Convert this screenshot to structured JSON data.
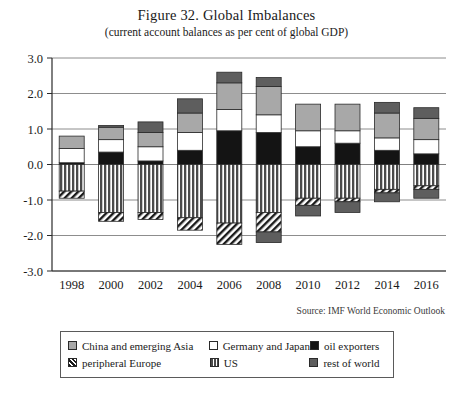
{
  "figure": {
    "title": "Figure 32. Global Imbalances",
    "subtitle": "(current account balances as per cent of global GDP)",
    "source": "Source: IMF World Economic Outlook"
  },
  "legend": {
    "entries": [
      {
        "label": "China and emerging Asia",
        "key": "china",
        "pattern": "solid-light-gray",
        "color": "#a8a8a8"
      },
      {
        "label": "Germany and Japan",
        "key": "germany_japan",
        "pattern": "solid-white",
        "color": "#ffffff"
      },
      {
        "label": "oil exporters",
        "key": "oil_exporters",
        "pattern": "solid-black",
        "color": "#111111"
      },
      {
        "label": "peripheral Europe",
        "key": "peripheral_europe",
        "pattern": "diagonal-hatch",
        "color": "#ffffff"
      },
      {
        "label": "US",
        "key": "us",
        "pattern": "vertical-stripes",
        "color": "#555555"
      },
      {
        "label": "rest of world",
        "key": "rest_of_world",
        "pattern": "solid-dark-gray",
        "color": "#5e5e5e"
      }
    ]
  },
  "chart_data": {
    "type": "bar",
    "subtype": "stacked-bar-diverging",
    "title": "Figure 32. Global Imbalances",
    "subtitle": "(current account balances as per cent of global GDP)",
    "xlabel": "",
    "ylabel": "",
    "ylim": [
      -3.0,
      3.0
    ],
    "yticks": [
      3.0,
      2.0,
      1.0,
      0.0,
      -1.0,
      -2.0,
      -3.0
    ],
    "ytick_labels": [
      "3.0",
      "2.0",
      "1.0",
      "0.0",
      "-1.0",
      "-2.0",
      "-3.0"
    ],
    "grid": true,
    "legend_position": "bottom",
    "categories": [
      "1998",
      "2000",
      "2002",
      "2004",
      "2006",
      "2008",
      "2010",
      "2012",
      "2014",
      "2016"
    ],
    "series": [
      {
        "name": "China and emerging Asia",
        "key": "china",
        "values": [
          0.35,
          0.35,
          0.4,
          0.55,
          0.75,
          0.8,
          0.75,
          0.75,
          0.7,
          0.6
        ]
      },
      {
        "name": "Germany and Japan",
        "key": "germany_japan",
        "values": [
          0.4,
          0.35,
          0.4,
          0.5,
          0.6,
          0.5,
          0.45,
          0.35,
          0.35,
          0.4
        ]
      },
      {
        "name": "oil exporters",
        "key": "oil_exporters",
        "values": [
          0.05,
          0.35,
          0.1,
          0.4,
          0.95,
          0.9,
          0.5,
          0.6,
          0.4,
          0.3
        ]
      },
      {
        "name": "rest of world",
        "key": "rest_of_world",
        "values": [
          0.0,
          0.05,
          0.3,
          0.4,
          0.3,
          0.25,
          0.0,
          0.0,
          0.3,
          0.3
        ]
      },
      {
        "name": "US",
        "key": "us",
        "values": [
          -0.75,
          -1.35,
          -1.35,
          -1.5,
          -1.65,
          -1.35,
          -0.95,
          -0.95,
          -0.7,
          -0.6
        ]
      },
      {
        "name": "peripheral Europe",
        "key": "peripheral_europe",
        "values": [
          -0.2,
          -0.25,
          -0.2,
          -0.35,
          -0.6,
          -0.55,
          -0.2,
          -0.1,
          -0.1,
          -0.1
        ]
      },
      {
        "name": "rest of world (negative)",
        "key": "rest_of_world_neg",
        "values": [
          0.0,
          0.0,
          0.0,
          0.0,
          0.0,
          -0.3,
          -0.3,
          -0.3,
          -0.25,
          -0.25
        ]
      }
    ],
    "positive_stack_order": [
      "oil_exporters",
      "germany_japan",
      "china",
      "rest_of_world"
    ],
    "negative_stack_order": [
      "us",
      "peripheral_europe",
      "rest_of_world_neg"
    ],
    "bar_totals_positive": [
      0.8,
      1.1,
      1.2,
      1.85,
      2.6,
      2.45,
      1.7,
      1.7,
      1.45,
      1.3
    ],
    "bar_totals_negative": [
      -0.95,
      -1.6,
      -1.55,
      -1.85,
      -2.25,
      -2.2,
      -1.45,
      -1.35,
      -1.05,
      -0.95
    ]
  }
}
